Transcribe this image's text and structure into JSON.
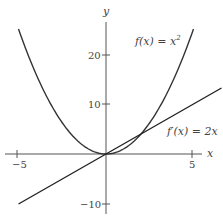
{
  "chart_data": {
    "type": "line",
    "title": "",
    "xlabel": "x",
    "ylabel": "y",
    "xlim": [
      -5.5,
      5.5
    ],
    "ylim": [
      -12,
      26
    ],
    "xticks": [
      -5,
      5
    ],
    "xtick_labels": [
      "−5",
      "5"
    ],
    "yticks": [
      -10,
      10,
      20
    ],
    "ytick_labels": [
      "−10",
      "10",
      "20"
    ],
    "grid": false,
    "legend": "none",
    "series": [
      {
        "name": "f(x) = x^2",
        "label": "f(x) = x²",
        "expression": "x^2",
        "x": [
          -5,
          -4,
          -3,
          -2,
          -1,
          0,
          1,
          2,
          3,
          4,
          5
        ],
        "values": [
          25,
          16,
          9,
          4,
          1,
          0,
          1,
          4,
          9,
          16,
          25
        ],
        "color": "#333333"
      },
      {
        "name": "f'(x) = 2x",
        "label": "f′(x) = 2x",
        "expression": "2x",
        "x": [
          -5,
          0,
          5,
          6.6
        ],
        "values": [
          -10,
          0,
          10,
          13.2
        ],
        "color": "#222222"
      }
    ],
    "annotations": [
      {
        "text": "f(x) = x²",
        "near": "parabola right branch, upper"
      },
      {
        "text": "f′(x) = 2x",
        "near": "line, right side"
      }
    ]
  },
  "labels": {
    "x_axis": "x",
    "y_axis": "y",
    "x_tick_neg5": "−5",
    "x_tick_5": "5",
    "y_tick_20": "20",
    "y_tick_10": "10",
    "y_tick_neg10": "−10",
    "f_label_pre": "f(x) = x",
    "f_label_sup": "2",
    "fp_label": "f′(x) = 2x"
  }
}
